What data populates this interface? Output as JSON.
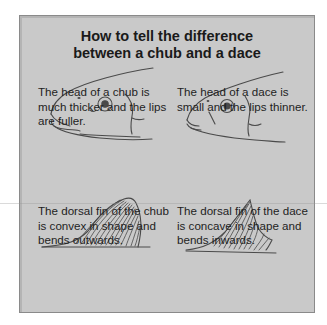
{
  "title": {
    "line1": "How to tell the difference",
    "line2": "between a chub and a dace"
  },
  "panels": [
    {
      "subject": "chub",
      "part": "head",
      "icon": "chub-head-illustration",
      "caption": "The head of a chub is much thicker and the lips are fuller."
    },
    {
      "subject": "dace",
      "part": "head",
      "icon": "dace-head-illustration",
      "caption": "The head of a dace is small and the lips thinner."
    },
    {
      "subject": "chub",
      "part": "dorsal fin",
      "icon": "chub-dorsal-fin-illustration",
      "caption": "The dorsal fin of the chub is convex in shape and bends outwards."
    },
    {
      "subject": "dace",
      "part": "dorsal fin",
      "icon": "dace-dorsal-fin-illustration",
      "caption": "The dorsal fin of the dace is concave in shape and bends inwards."
    }
  ],
  "colors": {
    "panel_fill": "#c9c9c9",
    "panel_border": "#8a8a8a",
    "line_art": "#4a4a4a",
    "text": "#1a1a1a"
  }
}
